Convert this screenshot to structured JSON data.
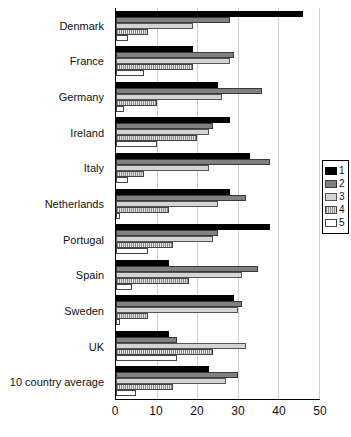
{
  "chart_data": {
    "type": "bar",
    "orientation": "horizontal",
    "title": "",
    "xlabel": "",
    "ylabel": "",
    "xlim": [
      0,
      50
    ],
    "grid": true,
    "grid_axis": "x",
    "legend_position": "right",
    "xticks": [
      "0",
      "10",
      "20",
      "30",
      "40",
      "50"
    ],
    "xtick_values": [
      0,
      10,
      20,
      30,
      40,
      50
    ],
    "categories": [
      "Denmark",
      "France",
      "Germany",
      "Ireland",
      "Italy",
      "Netherlands",
      "Portugal",
      "Spain",
      "Sweden",
      "UK",
      "10 country average"
    ],
    "series": [
      {
        "name": "1",
        "color": "#000000",
        "values": [
          46,
          19,
          25,
          28,
          33,
          28,
          38,
          13,
          29,
          13,
          23
        ]
      },
      {
        "name": "2",
        "color": "#808080",
        "values": [
          28,
          29,
          36,
          24,
          38,
          32,
          25,
          35,
          31,
          15,
          30
        ]
      },
      {
        "name": "3",
        "color": "#d4d4d4",
        "values": [
          19,
          28,
          26,
          23,
          23,
          25,
          24,
          31,
          30,
          32,
          27
        ]
      },
      {
        "name": "4",
        "color": "#c0c0c0",
        "values": [
          8,
          19,
          10,
          20,
          7,
          13,
          14,
          18,
          8,
          24,
          14
        ]
      },
      {
        "name": "5",
        "color": "#ffffff",
        "values": [
          3,
          7,
          2,
          10,
          3,
          1,
          8,
          4,
          1,
          15,
          5
        ]
      }
    ],
    "legend": [
      {
        "label": "1",
        "swatch": "solid-black"
      },
      {
        "label": "2",
        "swatch": "solid-dark-gray"
      },
      {
        "label": "3",
        "swatch": "solid-light-gray"
      },
      {
        "label": "4",
        "swatch": "crosshatch-gray"
      },
      {
        "label": "5",
        "swatch": "solid-white"
      }
    ]
  }
}
